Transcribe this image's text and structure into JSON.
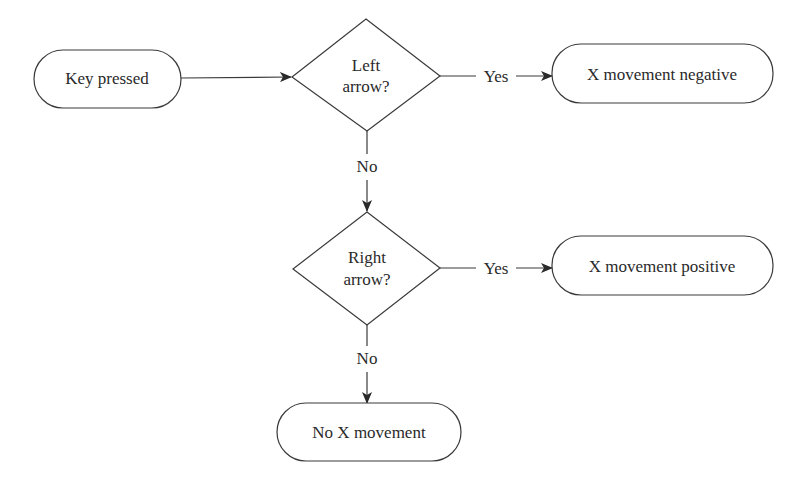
{
  "diagram": {
    "type": "flowchart",
    "nodes": {
      "start": {
        "label": "Key pressed",
        "shape": "terminal"
      },
      "left_decision": {
        "line1": "Left",
        "line2": "arrow?",
        "shape": "decision"
      },
      "x_negative": {
        "label": "X movement negative",
        "shape": "terminal"
      },
      "right_decision": {
        "line1": "Right",
        "line2": "arrow?",
        "shape": "decision"
      },
      "x_positive": {
        "label": "X movement positive",
        "shape": "terminal"
      },
      "no_movement": {
        "label": "No X movement",
        "shape": "terminal"
      }
    },
    "edges": {
      "start_to_left": {
        "from": "start",
        "to": "left_decision",
        "label": ""
      },
      "left_yes": {
        "from": "left_decision",
        "to": "x_negative",
        "label": "Yes"
      },
      "left_no": {
        "from": "left_decision",
        "to": "right_decision",
        "label": "No"
      },
      "right_yes": {
        "from": "right_decision",
        "to": "x_positive",
        "label": "Yes"
      },
      "right_no": {
        "from": "right_decision",
        "to": "no_movement",
        "label": "No"
      }
    }
  }
}
